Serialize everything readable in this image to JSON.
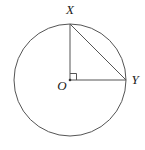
{
  "figure": {
    "background_color": "#ffffff",
    "stroke_color": "#555555",
    "label_color": "#1a1a1a",
    "width": 145,
    "height": 150
  },
  "circle": {
    "name": "circle-O",
    "center_x": 70,
    "center_y": 80,
    "radius": 56,
    "stroke_width": 1
  },
  "points": {
    "center": {
      "label": "O",
      "x": 70,
      "y": 80,
      "label_x": 62,
      "label_y": 90
    },
    "top": {
      "label": "X",
      "x": 70,
      "y": 24,
      "label_x": 70,
      "label_y": 14
    },
    "right": {
      "label": "Y",
      "x": 126,
      "y": 80,
      "label_x": 135,
      "label_y": 84
    }
  },
  "segments": [
    {
      "name": "radius-OX",
      "x1": 70,
      "y1": 80,
      "x2": 70,
      "y2": 24
    },
    {
      "name": "radius-OY",
      "x1": 70,
      "y1": 80,
      "x2": 126,
      "y2": 80
    },
    {
      "name": "chord-XY",
      "x1": 70,
      "y1": 24,
      "x2": 126,
      "y2": 80
    }
  ],
  "right_angle_marker": {
    "name": "right-angle-XOY",
    "size": 6,
    "x": 70,
    "y": 80
  },
  "center_dot": {
    "x": 70,
    "y": 80,
    "radius": 1.3
  }
}
